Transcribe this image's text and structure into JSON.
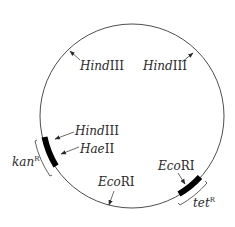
{
  "diagram": {
    "type": "plasmid-map",
    "colors": {
      "line": "#3a3a3a",
      "gene_block": "#000000",
      "text": "#2a2a2a",
      "background": "#ffffff"
    },
    "circle": {
      "cx": 132,
      "cy": 116,
      "r": 92
    },
    "sites": [
      {
        "id": "hindIII-top-left",
        "enzyme_italic": "Hind",
        "enzyme_rest": "III"
      },
      {
        "id": "hindIII-top-right",
        "enzyme_italic": "Hind",
        "enzyme_rest": "III"
      },
      {
        "id": "hindIII-left",
        "enzyme_italic": "Hind",
        "enzyme_rest": "III"
      },
      {
        "id": "haeII-left",
        "enzyme_italic": "Hae",
        "enzyme_rest": "II"
      },
      {
        "id": "ecoRI-bottom",
        "enzyme_italic": "Eco",
        "enzyme_rest": "RI"
      },
      {
        "id": "ecoRI-right",
        "enzyme_italic": "Eco",
        "enzyme_rest": "RI"
      }
    ],
    "genes": [
      {
        "id": "kanR",
        "name": "kan",
        "superscript": "R"
      },
      {
        "id": "tetR",
        "name": "tet",
        "superscript": "R"
      }
    ]
  }
}
